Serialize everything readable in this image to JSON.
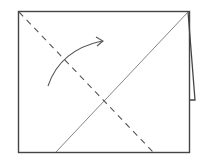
{
  "diagram": {
    "type": "origami-fold-step",
    "colors": {
      "background": "#ffffff",
      "outline": "#444444",
      "crease": "#777777",
      "fold_line": "#555555",
      "arrow": "#555555"
    },
    "paper": {
      "x1": 18,
      "y1": 11,
      "x2": 190,
      "y2": 152
    },
    "flap": {
      "top": [
        188,
        11
      ],
      "bottom_outer": [
        195,
        100
      ],
      "bottom_inner": [
        190,
        100
      ]
    },
    "crease_solid": {
      "from": [
        188,
        11
      ],
      "to": [
        56,
        152
      ]
    },
    "fold_dashed": {
      "from": [
        19,
        12
      ],
      "to": [
        153,
        152
      ]
    },
    "arrow": {
      "start": [
        48,
        86
      ],
      "control": [
        62,
        50
      ],
      "end": [
        103,
        41
      ]
    }
  }
}
